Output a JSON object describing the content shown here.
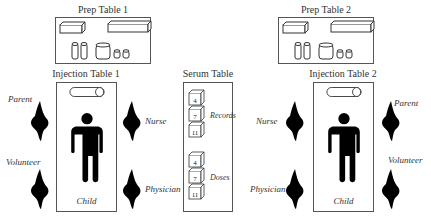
{
  "diagram": {
    "prep_tables": [
      {
        "title": "Prep Table 1"
      },
      {
        "title": "Prep Table 2"
      }
    ],
    "injection_tables": [
      {
        "title": "Injection Table 1",
        "patient_label": "Child",
        "people": {
          "top_left": "Parent",
          "bottom_left": "Volunteer",
          "top_right": "Nurse",
          "bottom_right": "Physician"
        }
      },
      {
        "title": "Injection Table 2",
        "patient_label": "Child",
        "people": {
          "top_left": "Nurse",
          "bottom_left": "Physician",
          "top_right": "Parent",
          "bottom_right": "Volunteer"
        }
      }
    ],
    "serum_table": {
      "title": "Serum Table",
      "groups": [
        {
          "label": "Records",
          "boxes": [
            "4",
            "7",
            "11"
          ]
        },
        {
          "label": "Doses",
          "boxes": [
            "4",
            "7",
            "11"
          ]
        }
      ]
    }
  }
}
